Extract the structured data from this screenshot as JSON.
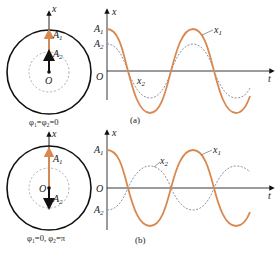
{
  "colors": {
    "x1_curve": "#d9894f",
    "x2_curve": "#7a8a99",
    "axis": "#222222",
    "circle": "#111111",
    "inner_circle": "#999999",
    "vector_A1": "#d9894f",
    "vector_A2": "#111111"
  },
  "panel_a": {
    "phasor": {
      "axis_label": "x",
      "vector1_label": "A",
      "vector1_sub": "1",
      "vector2_label": "A",
      "vector2_sub": "2",
      "origin_label": "O",
      "phase_caption": "φ₁=φ₂=0"
    },
    "graph": {
      "y_axis_label": "x",
      "x_axis_label": "t",
      "origin_label": "O",
      "tick_A1": "A",
      "tick_A1_sub": "1",
      "tick_A2": "A",
      "tick_A2_sub": "2",
      "curve1_label": "x",
      "curve1_sub": "1",
      "curve2_label": "x",
      "curve2_sub": "2"
    },
    "caption": "(a)"
  },
  "panel_b": {
    "phasor": {
      "axis_label": "x",
      "vector1_label": "A",
      "vector1_sub": "1",
      "vector2_label": "A",
      "vector2_sub": "2",
      "origin_label": "O",
      "phase_caption": "φ₁=0, φ₂=π"
    },
    "graph": {
      "y_axis_label": "x",
      "x_axis_label": "t",
      "origin_label": "O",
      "tick_A1": "A",
      "tick_A1_sub": "1",
      "tick_A2": "A",
      "tick_A2_sub": "2",
      "curve1_label": "x",
      "curve1_sub": "1",
      "curve2_label": "x",
      "curve2_sub": "2"
    },
    "caption": "(b)"
  }
}
